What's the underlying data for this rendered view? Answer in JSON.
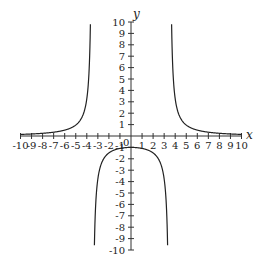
{
  "chart_data": {
    "type": "line",
    "title": "",
    "xlabel": "x",
    "ylabel": "y",
    "xlim": [
      -10,
      10
    ],
    "ylim": [
      -10,
      10
    ],
    "grid": false,
    "origin_label": "0",
    "x_ticks": [
      -10,
      -9,
      -8,
      -7,
      -6,
      -5,
      -4,
      -3,
      -2,
      -1,
      1,
      2,
      3,
      4,
      5,
      6,
      7,
      8,
      9,
      10
    ],
    "y_ticks": [
      -10,
      -9,
      -8,
      -7,
      -6,
      -5,
      -4,
      -3,
      -2,
      -1,
      1,
      2,
      3,
      4,
      5,
      6,
      7,
      8,
      9,
      10
    ],
    "function": "y = 12.25 / (x^2 - 12.25)",
    "vertical_asymptotes": [
      -3.5,
      3.5
    ],
    "horizontal_asymptote": 0,
    "series": [
      {
        "name": "left branch",
        "x": [
          -10,
          -8,
          -6,
          -5,
          -4.5,
          -4,
          -3.8
        ],
        "y": [
          0.14,
          0.24,
          0.52,
          0.96,
          1.53,
          2.61,
          5.39
        ]
      },
      {
        "name": "middle branch",
        "x": [
          -3.2,
          -3,
          -2,
          -1,
          0,
          1,
          2,
          3,
          3.2
        ],
        "y": [
          -5.31,
          -3.77,
          -1.49,
          -1.09,
          -1.0,
          -1.09,
          -1.49,
          -3.77,
          -5.31
        ]
      },
      {
        "name": "right branch",
        "x": [
          3.8,
          4,
          4.5,
          5,
          6,
          8,
          10
        ],
        "y": [
          5.39,
          2.61,
          1.53,
          0.96,
          0.52,
          0.24,
          0.14
        ]
      }
    ]
  }
}
